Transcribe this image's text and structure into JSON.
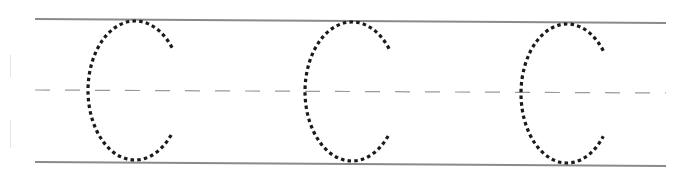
{
  "worksheet": {
    "type": "handwriting-tracing-practice",
    "letter": "C",
    "letter_count": 3,
    "guides": {
      "top_line": {
        "style": "solid",
        "color": "#8a8a8a",
        "x1": 35,
        "y1": 19,
        "x2": 666,
        "y2": 23
      },
      "mid_line": {
        "style": "dashed",
        "color": "#9a9a9a",
        "x1": 35,
        "y1": 90,
        "x2": 666,
        "y2": 93,
        "dash": "15 15"
      },
      "bottom_line": {
        "style": "solid",
        "color": "#8a8a8a",
        "x1": 35,
        "y1": 162,
        "x2": 666,
        "y2": 166
      }
    },
    "letters": [
      {
        "char": "C",
        "cx": 135,
        "top": 21,
        "bottom": 160,
        "left": 88,
        "tip_x": 182
      },
      {
        "char": "C",
        "cx": 352,
        "top": 22,
        "bottom": 161,
        "left": 305,
        "tip_x": 398
      },
      {
        "char": "C",
        "cx": 567,
        "top": 24,
        "bottom": 163,
        "left": 521,
        "tip_x": 614
      }
    ],
    "colors": {
      "trace": "#1a1a1a",
      "background": "#ffffff"
    }
  }
}
